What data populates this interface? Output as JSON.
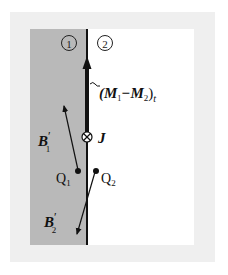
{
  "figure": {
    "regions": [
      {
        "id": "region-1",
        "label": "①",
        "fill": "#b9b9b9"
      },
      {
        "id": "region-2",
        "label": "②",
        "fill": "#ffffff"
      }
    ],
    "frame_color": "#efefef",
    "boundary_color": "#111111",
    "labels": {
      "magnetization_diff": "(M",
      "magnetization_sub1": "1",
      "magnetization_minus": "−M",
      "magnetization_sub2": "2",
      "magnetization_close": ")",
      "magnetization_tangent": "t",
      "current_density": "J",
      "b1_main": "B",
      "b1_prime": "′",
      "b1_sub": "1",
      "b2_main": "B",
      "b2_prime": "′",
      "b2_sub": "2",
      "q1_main": "Q",
      "q1_sub": "1",
      "q2_main": "Q",
      "q2_sub": "2"
    },
    "symbols": {
      "current_into_page": "⊗"
    }
  }
}
